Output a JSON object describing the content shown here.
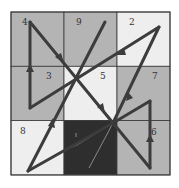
{
  "grid": {
    "x0": 11,
    "y0": 12,
    "cell_w": 53,
    "cell_h": 54.3,
    "border_color": "#3a3a3a",
    "cells": [
      {
        "label": "4",
        "row": 0,
        "col": 0,
        "fill": "#b4b4b4",
        "lx": 22,
        "ly": 25
      },
      {
        "label": "9",
        "row": 0,
        "col": 1,
        "fill": "#b4b4b4",
        "lx": 76,
        "ly": 25
      },
      {
        "label": "2",
        "row": 0,
        "col": 2,
        "fill": "#eeeeee",
        "lx": 129,
        "ly": 25
      },
      {
        "label": "3",
        "row": 1,
        "col": 0,
        "fill": "#b4b4b4",
        "lx": 46,
        "ly": 79
      },
      {
        "label": "5",
        "row": 1,
        "col": 1,
        "fill": "#eeeeee",
        "lx": 100,
        "ly": 79
      },
      {
        "label": "7",
        "row": 1,
        "col": 2,
        "fill": "#b4b4b4",
        "lx": 152,
        "ly": 79
      },
      {
        "label": "8",
        "row": 2,
        "col": 0,
        "fill": "#eeeeee",
        "lx": 20,
        "ly": 134
      },
      {
        "label": "1",
        "row": 2,
        "col": 1,
        "fill": "#2e2e2e",
        "lx": 75,
        "ly": 134
      },
      {
        "label": "6",
        "row": 2,
        "col": 2,
        "fill": "#b4b4b4",
        "lx": 151,
        "ly": 135
      }
    ]
  },
  "path": {
    "color": "#3c3c3c",
    "faint_color": "#8a8a8a",
    "sequence": [
      "1",
      "2",
      "3",
      "4",
      "5",
      "6",
      "7",
      "8",
      "9"
    ]
  }
}
